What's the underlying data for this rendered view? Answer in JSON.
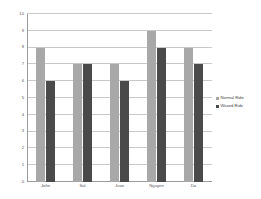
{
  "chart_data": {
    "type": "bar",
    "title": "",
    "subtitle": "",
    "xlabel": "",
    "ylabel": "",
    "categories": [
      "John",
      "Sal",
      "Juan",
      "Nguyen",
      "Da"
    ],
    "series": [
      {
        "name": "Normal Ride",
        "color": "#a8a8a8",
        "values": [
          8,
          7,
          7,
          9,
          8
        ]
      },
      {
        "name": "Waxed Ride",
        "color": "#4a4a4a",
        "values": [
          6,
          7,
          6,
          8,
          7
        ]
      }
    ],
    "ylim": [
      0,
      10
    ],
    "ytick_labels": [
      "0",
      "1",
      "2",
      "3",
      "4",
      "5",
      "6",
      "7",
      "8",
      "9",
      "10"
    ],
    "ytick_values": [
      0,
      1,
      2,
      3,
      4,
      5,
      6,
      7,
      8,
      9,
      10
    ],
    "grid": true,
    "grid_orientation": "horizontal",
    "legend_position": "right",
    "legend_entries": [
      "Normal Ride",
      "Waxed Ride"
    ],
    "bar_orientation": "vertical",
    "grouping": "grouped",
    "background_color": "#ffffff",
    "axis_color": "#9a9a9a",
    "gridline_color": "#c9c9c9"
  }
}
